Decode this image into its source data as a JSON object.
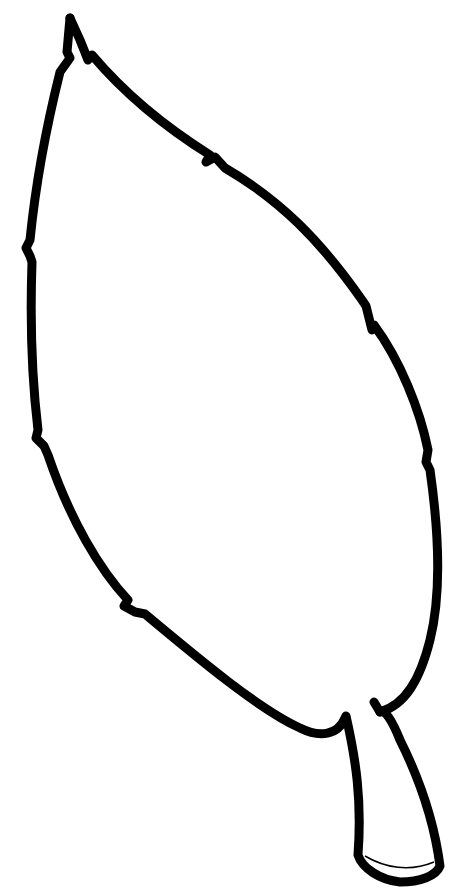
{
  "image": {
    "subject": "leaf outline drawing",
    "background_color": "#ffffff",
    "stroke_color": "#000000",
    "stroke_width": 9
  }
}
